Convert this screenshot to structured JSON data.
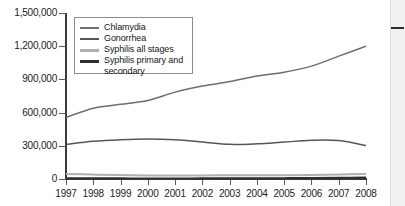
{
  "chart_data": {
    "type": "line",
    "title": "",
    "xlabel": "",
    "ylabel": "",
    "grid": false,
    "legend_position": "top-left",
    "x": [
      1997,
      1998,
      1999,
      2000,
      2001,
      2002,
      2003,
      2004,
      2005,
      2006,
      2007,
      2008
    ],
    "xtick_labels": [
      "1997",
      "1998",
      "1999",
      "2000",
      "2001",
      "2002",
      "2003",
      "2004",
      "2005",
      "2006",
      "2007",
      "2008"
    ],
    "ytick_labels": [
      "0",
      "300,000",
      "600,000",
      "900,000",
      "1,200,000",
      "1,500,000"
    ],
    "ytick_values": [
      0,
      300000,
      600000,
      900000,
      1200000,
      1500000
    ],
    "ylim": [
      0,
      1500000
    ],
    "xlim": [
      1997,
      2008
    ],
    "series": [
      {
        "name": "Chlamydia",
        "color": "#6e6e6e",
        "values": [
          556000,
          640000,
          675000,
          710000,
          785000,
          840000,
          880000,
          930000,
          965000,
          1020000,
          1110000,
          1200000
        ]
      },
      {
        "name": "Gonorrhea",
        "color": "#565656",
        "values": [
          312000,
          340000,
          355000,
          362000,
          355000,
          335000,
          313000,
          318000,
          334000,
          350000,
          348000,
          302000
        ]
      },
      {
        "name": "Syphilis all stages",
        "color": "#b0b0b0",
        "values": [
          46000,
          40000,
          36000,
          32000,
          32000,
          32000,
          34000,
          34000,
          34000,
          36000,
          41000,
          46000
        ]
      },
      {
        "name": "Syphilis primary and secondary",
        "color": "#2e2e2e",
        "values": [
          8600,
          7000,
          6700,
          5980,
          6100,
          6860,
          7180,
          7980,
          8720,
          9760,
          11460,
          13500
        ]
      }
    ]
  },
  "legend": {
    "entries": [
      {
        "label": "Chlamydia",
        "continuation": ""
      },
      {
        "label": "Gonorrhea",
        "continuation": ""
      },
      {
        "label": "Syphilis all stages",
        "continuation": ""
      },
      {
        "label": "Syphilis primary and",
        "continuation": "secondary"
      }
    ]
  },
  "colors": {
    "background": "#ffffff",
    "axis": "#3a3a3a",
    "text": "#1c1c1c",
    "legend_border": "#8c8c8c",
    "right_strip": "#f1f1f1",
    "right_strip_mark": "#2b2b2b"
  }
}
